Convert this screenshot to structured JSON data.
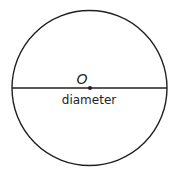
{
  "diagram": {
    "center_label": "O",
    "line_label": "diameter",
    "stroke_color": "#231f20",
    "background": "#ffffff"
  }
}
